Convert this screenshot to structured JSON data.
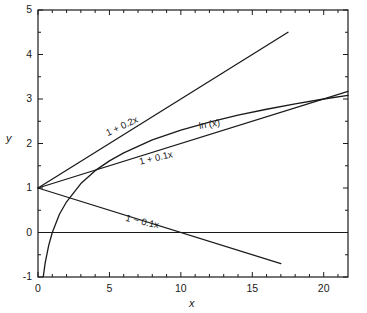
{
  "chart_data": {
    "type": "line",
    "title": "",
    "xlabel": "x",
    "ylabel": "y",
    "xlim": [
      0,
      21.7
    ],
    "ylim": [
      -1,
      5
    ],
    "grid": false,
    "legend": "inline-curve-labels",
    "x_ticks": [
      0,
      5,
      10,
      15,
      20
    ],
    "x_tick_labels": [
      "0",
      "5",
      "10",
      "15",
      "20"
    ],
    "x_minor_step": 1,
    "y_ticks": [
      -1,
      0,
      1,
      2,
      3,
      4,
      5
    ],
    "y_tick_labels": [
      "-1",
      "0",
      "1",
      "2",
      "3",
      "4",
      "5"
    ],
    "y_minor_step": 0.5,
    "axis_color": "#1a1a1a",
    "curve_color": "#1a1a1a",
    "series": [
      {
        "name": "ln (x)",
        "label": "ln (x)",
        "expression": "ln(x)",
        "x_range": [
          0.37,
          21.7
        ],
        "label_x": 11.2,
        "label_y": 2.52,
        "label_rotation": -9,
        "x": [
          0.37,
          0.5,
          0.75,
          1,
          1.5,
          2,
          3,
          4,
          5,
          6,
          8,
          10,
          12,
          14,
          16,
          18,
          20,
          21.7
        ],
        "y": [
          -0.99,
          -0.69,
          -0.29,
          0,
          0.41,
          0.69,
          1.1,
          1.39,
          1.61,
          1.79,
          2.08,
          2.3,
          2.48,
          2.64,
          2.77,
          2.89,
          3.0,
          3.08
        ]
      },
      {
        "name": "1 + 0.2x",
        "label": "1 + 0.2x",
        "expression": "1 + 0.2*x",
        "x_range": [
          0,
          17.5
        ],
        "label_x": 4.6,
        "label_y": 2.35,
        "label_rotation": -25,
        "x": [
          0,
          17.5
        ],
        "y": [
          1,
          4.5
        ]
      },
      {
        "name": "1 + 0.1x",
        "label": "1 + 0.1x",
        "expression": "1 + 0.1*x",
        "x_range": [
          0,
          21.7
        ],
        "label_x": 7.0,
        "label_y": 1.72,
        "label_rotation": -13,
        "x": [
          0,
          21.7
        ],
        "y": [
          1,
          3.17
        ]
      },
      {
        "name": "1 - 0.1x",
        "label": "1 − 0.1x",
        "expression": "1 - 0.1*x",
        "x_range": [
          0,
          17.0
        ],
        "label_x": 6.2,
        "label_y": 0.47,
        "label_rotation": 13,
        "x": [
          0,
          17.0
        ],
        "y": [
          1,
          -0.7
        ]
      }
    ],
    "reference_lines": [
      {
        "name": "y-zero-line",
        "orientation": "horizontal",
        "value": 0
      }
    ]
  }
}
